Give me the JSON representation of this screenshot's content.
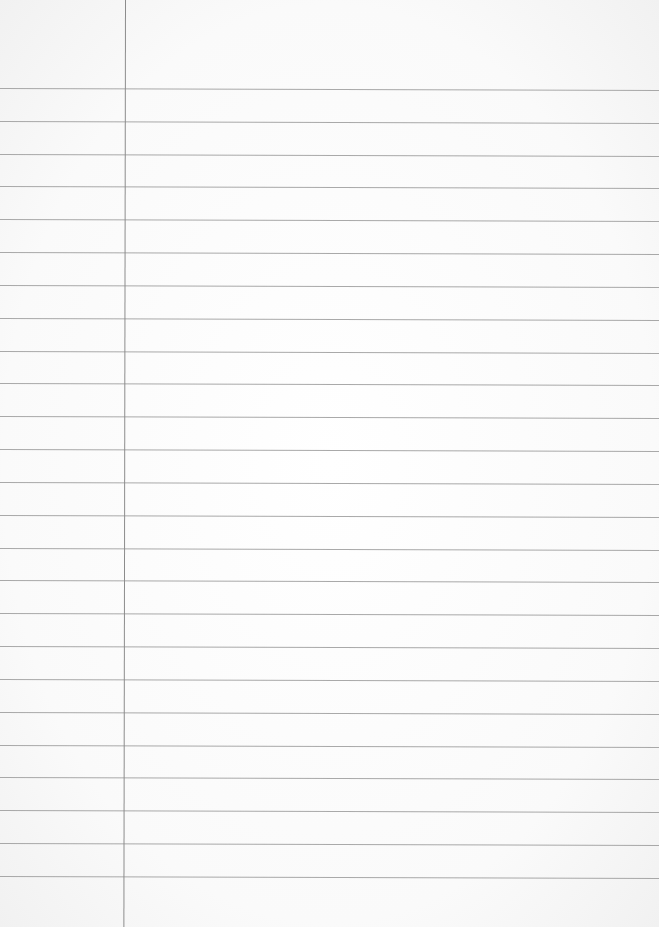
{
  "page": {
    "type": "blank ruled notebook paper",
    "background_color": "#fbfbfb",
    "rule_color": "#9a9a9a",
    "margin_line_color": "#8c8c8c",
    "margin_line_x": 125,
    "first_rule_y": 88,
    "rule_spacing": 32.83,
    "rule_count": 25
  }
}
